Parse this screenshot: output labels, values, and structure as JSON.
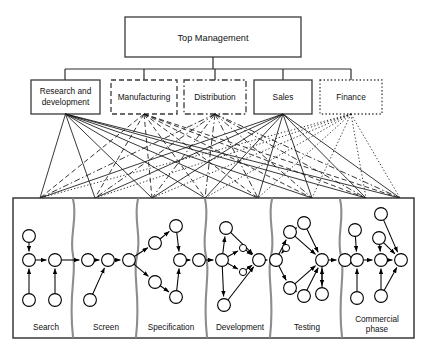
{
  "diagram": {
    "type": "organization-and-innovation-process-diagram",
    "top": {
      "label": "Top Management",
      "box": {
        "x": 125,
        "y": 17,
        "w": 176,
        "h": 40
      },
      "border_style": "solid"
    },
    "departments": [
      {
        "id": "rnd",
        "label": "Research and development",
        "lines": [
          "Research and",
          "development"
        ],
        "border_style": "solid",
        "box": {
          "x": 31,
          "y": 80,
          "w": 69,
          "h": 34
        }
      },
      {
        "id": "manufacturing",
        "label": "Manufacturing",
        "lines": [
          "Manufacturing"
        ],
        "border_style": "dashed",
        "box": {
          "x": 111,
          "y": 80,
          "w": 66,
          "h": 34
        }
      },
      {
        "id": "distribution",
        "label": "Distribution",
        "lines": [
          "Distribution"
        ],
        "border_style": "dash-dot",
        "box": {
          "x": 184,
          "y": 80,
          "w": 62,
          "h": 34
        }
      },
      {
        "id": "sales",
        "label": "Sales",
        "lines": [
          "Sales"
        ],
        "border_style": "solid",
        "box": {
          "x": 254,
          "y": 80,
          "w": 58,
          "h": 34
        }
      },
      {
        "id": "finance",
        "label": "Finance",
        "lines": [
          "Finance"
        ],
        "border_style": "dotted",
        "box": {
          "x": 320,
          "y": 80,
          "w": 62,
          "h": 34
        }
      }
    ],
    "process_box": {
      "x": 13,
      "y": 198,
      "w": 401,
      "h": 140,
      "border_style": "solid"
    },
    "stages": [
      {
        "id": "search",
        "label": "Search",
        "lines": [
          "Search"
        ],
        "label_x": 46,
        "label_y": 330
      },
      {
        "id": "screen",
        "label": "Screen",
        "lines": [
          "Screen"
        ],
        "label_x": 106,
        "label_y": 330
      },
      {
        "id": "specification",
        "label": "Specification",
        "lines": [
          "Specification"
        ],
        "label_x": 171,
        "label_y": 330
      },
      {
        "id": "development",
        "label": "Development",
        "lines": [
          "Development"
        ],
        "label_x": 240,
        "label_y": 330
      },
      {
        "id": "testing",
        "label": "Testing",
        "lines": [
          "Testing"
        ],
        "label_x": 307,
        "label_y": 330
      },
      {
        "id": "commercial",
        "label": "Commercial phase",
        "lines": [
          "Commercial",
          "phase"
        ],
        "label_x": 377,
        "label_y": 323
      }
    ],
    "colors": {
      "line": "#141414",
      "box_border": "#3a3a3a",
      "wave_divider": "#8d8d8d",
      "node_fill": "#ffffff",
      "background": "#ffffff",
      "text": "#111111"
    },
    "counts": {
      "departments": 5,
      "stages": 6
    }
  }
}
